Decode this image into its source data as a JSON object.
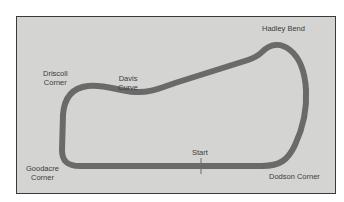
{
  "map": {
    "title": "Race circuit map",
    "background_color": "#d4d4d2",
    "border_color": "#3a3a3a",
    "track_color": "#6a6a6a",
    "labels": {
      "hadley_bend": "Hadley Bend",
      "driscoll_corner": "Driscoll\nCorner",
      "davis_curve": "Davis\nCurve",
      "goodacre_corner": "Goodacre\nCorner",
      "start": "Start",
      "dodson_corner": "Dodson Corner"
    }
  }
}
